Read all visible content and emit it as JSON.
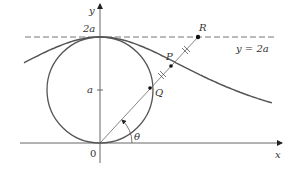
{
  "figure": {
    "type": "witch of Agnesi construction",
    "labels": {
      "y_axis": "y",
      "x_axis": "x",
      "origin": "0",
      "two_a": "2a",
      "a": "a",
      "line_eq": "y = 2a",
      "point_p": "P",
      "point_q": "Q",
      "point_r": "R",
      "angle": "θ"
    },
    "colors": {
      "curve": "#555555",
      "axes": "#666666",
      "dashed": "#777777",
      "points": "#111111"
    }
  }
}
